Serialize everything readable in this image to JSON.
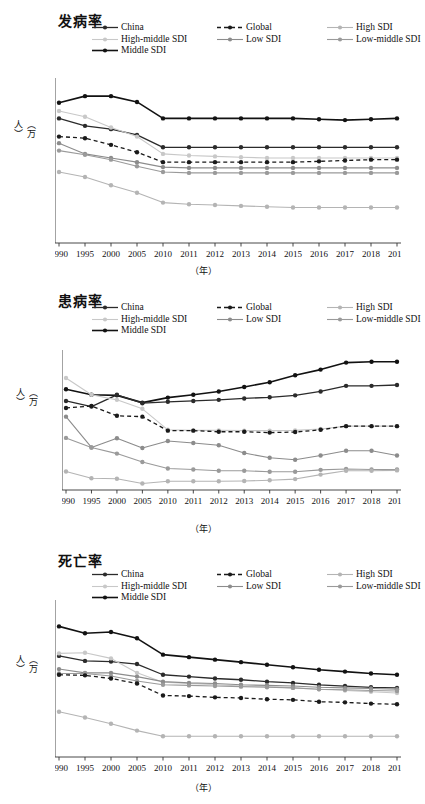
{
  "figure": {
    "width": 411,
    "height": 804,
    "y_axis_label": "（万人）",
    "x_axis_label": "（年）",
    "background": "#ffffff"
  },
  "series_style": {
    "China": {
      "color": "#2b2b2b",
      "dash": "none",
      "width": 1.3
    },
    "Global": {
      "color": "#1a1a1a",
      "dash": "4,3",
      "width": 1.3
    },
    "High SDI": {
      "color": "#b4b4b4",
      "dash": "none",
      "width": 1.1
    },
    "High-middle SDI": {
      "color": "#c8c8c8",
      "dash": "none",
      "width": 1.1
    },
    "Low SDI": {
      "color": "#8c8c8c",
      "dash": "none",
      "width": 1.1
    },
    "Low-middle SDI": {
      "color": "#9a9a9a",
      "dash": "none",
      "width": 1.1
    },
    "Middle SDI": {
      "color": "#121212",
      "dash": "none",
      "width": 1.6
    }
  },
  "legend_order": [
    "China",
    "Global",
    "High SDI",
    "High-middle SDI",
    "Low SDI",
    "Low-middle SDI",
    "Middle SDI"
  ],
  "charts": [
    {
      "id": "incidence",
      "title": "发病率",
      "chart_data": {
        "type": "line",
        "title": "发病率",
        "xlabel": "（年）",
        "ylabel": "（万人）",
        "grid": false,
        "legend_position": "top",
        "categories": [
          "1990",
          "1995",
          "2000",
          "2005",
          "2010",
          "2011",
          "2012",
          "2013",
          "2014",
          "2015",
          "2016",
          "2017",
          "2018",
          "2019"
        ],
        "ylim": [
          50,
          250
        ],
        "yticks": [
          50,
          70,
          90,
          110,
          130,
          150,
          170,
          190,
          210,
          230,
          250
        ],
        "series": [
          {
            "name": "Middle SDI",
            "values": [
              220,
              228,
              228,
              221,
              201,
              201,
              201,
              201,
              201,
              201,
              200,
              199,
              200,
              201
            ]
          },
          {
            "name": "China",
            "values": [
              201,
              192,
              188,
              181,
              166,
              166,
              166,
              166,
              166,
              166,
              166,
              166,
              166,
              166
            ]
          },
          {
            "name": "High-middle SDI",
            "values": [
              210,
              203,
              190,
              179,
              158,
              156,
              155,
              154,
              153,
              153,
              153,
              153,
              153,
              153
            ]
          },
          {
            "name": "Global",
            "values": [
              179,
              177,
              169,
              160,
              148,
              148,
              148,
              148,
              148,
              148,
              149,
              150,
              151,
              151
            ]
          },
          {
            "name": "Low SDI",
            "values": [
              171,
              158,
              153,
              148,
              142,
              141,
              141,
              141,
              141,
              141,
              141,
              141,
              141,
              141
            ]
          },
          {
            "name": "Low-middle SDI",
            "values": [
              162,
              157,
              151,
              143,
              136,
              135,
              135,
              135,
              135,
              135,
              135,
              135,
              135,
              135
            ]
          },
          {
            "name": "High SDI",
            "values": [
              136,
              130,
              120,
              111,
              99,
              97,
              96,
              95,
              94,
              93,
              93,
              93,
              93,
              93
            ]
          }
        ]
      }
    },
    {
      "id": "prevalence",
      "title": "患病率",
      "chart_data": {
        "type": "line",
        "title": "患病率",
        "xlabel": "（年）",
        "ylabel": "（万人）",
        "grid": false,
        "legend_position": "top",
        "categories": [
          "1990",
          "1995",
          "2000",
          "2005",
          "2010",
          "2011",
          "2012",
          "2013",
          "2014",
          "2015",
          "2016",
          "2017",
          "2018",
          "2019"
        ],
        "ylim": [
          1000,
          1500
        ],
        "yticks": [
          1000,
          1050,
          1100,
          1150,
          1200,
          1250,
          1300,
          1350,
          1400,
          1450,
          1500
        ],
        "series": [
          {
            "name": "Middle SDI",
            "values": [
              1360,
              1340,
              1338,
              1312,
              1330,
              1340,
              1352,
              1368,
              1385,
              1410,
              1430,
              1455,
              1458,
              1458
            ]
          },
          {
            "name": "China",
            "values": [
              1318,
              1298,
              1340,
              1310,
              1315,
              1318,
              1322,
              1327,
              1331,
              1338,
              1352,
              1372,
              1372,
              1375
            ]
          },
          {
            "name": "High-middle SDI",
            "values": [
              1400,
              1340,
              1322,
              1290,
              1215,
              1213,
              1213,
              1212,
              1212,
              1213,
              1218,
              1228,
              1228,
              1228
            ]
          },
          {
            "name": "Global",
            "values": [
              1293,
              1300,
              1265,
              1262,
              1212,
              1212,
              1208,
              1208,
              1205,
              1207,
              1215,
              1228,
              1228,
              1228
            ]
          },
          {
            "name": "Low SDI",
            "values": [
              1262,
              1152,
              1185,
              1150,
              1175,
              1168,
              1160,
              1132,
              1115,
              1108,
              1123,
              1140,
              1140,
              1123
            ]
          },
          {
            "name": "Low-middle SDI",
            "values": [
              1186,
              1152,
              1130,
              1100,
              1077,
              1073,
              1069,
              1069,
              1065,
              1065,
              1072,
              1075,
              1073,
              1073
            ]
          },
          {
            "name": "High SDI",
            "values": [
              1066,
              1042,
              1040,
              1023,
              1031,
              1031,
              1031,
              1032,
              1035,
              1039,
              1055,
              1069,
              1069,
              1070
            ]
          }
        ]
      }
    },
    {
      "id": "mortality",
      "title": "死亡率",
      "chart_data": {
        "type": "line",
        "title": "死亡率",
        "xlabel": "（年）",
        "ylabel": "（万人）",
        "grid": false,
        "legend_position": "top",
        "categories": [
          "1990",
          "1995",
          "2000",
          "2005",
          "2010",
          "2011",
          "2012",
          "2013",
          "2014",
          "2015",
          "2016",
          "2017",
          "2018",
          "2019"
        ],
        "ylim": [
          0,
          250
        ],
        "yticks": [
          0,
          50,
          100,
          150,
          200,
          250
        ],
        "series": [
          {
            "name": "Middle SDI",
            "values": [
              208,
              197,
              199,
              189,
              163,
              159,
              155,
              151,
              147,
              143,
              139,
              136,
              133,
              131
            ]
          },
          {
            "name": "China",
            "values": [
              161,
              153,
              152,
              148,
              131,
              128,
              125,
              123,
              120,
              118,
              115,
              113,
              111,
              110
            ]
          },
          {
            "name": "High-middle SDI",
            "values": [
              165,
              166,
              157,
              134,
              119,
              117,
              115,
              113,
              112,
              110,
              108,
              106,
              104,
              102
            ]
          },
          {
            "name": "Low SDI",
            "values": [
              140,
              134,
              134,
              128,
              120,
              118,
              117,
              115,
              114,
              113,
              111,
              110,
              109,
              108
            ]
          },
          {
            "name": "Low-middle SDI",
            "values": [
              133,
              133,
              129,
              121,
              115,
              114,
              113,
              112,
              111,
              110,
              108,
              107,
              106,
              105
            ]
          },
          {
            "name": "Global",
            "values": [
              131,
              130,
              125,
              117,
              98,
              97,
              95,
              94,
              92,
              91,
              88,
              87,
              85,
              84
            ]
          },
          {
            "name": "High SDI",
            "values": [
              72,
              63,
              53,
              42,
              33,
              33,
              33,
              33,
              33,
              33,
              33,
              33,
              33,
              33
            ]
          }
        ]
      }
    }
  ]
}
